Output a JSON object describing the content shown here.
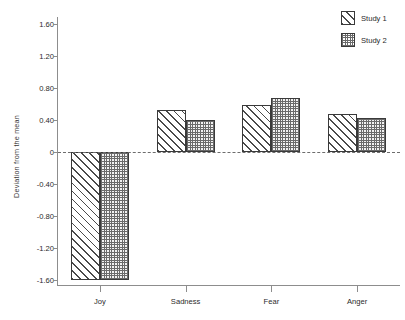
{
  "chart_data": {
    "type": "bar",
    "title": "",
    "subtitle": "",
    "xlabel": "",
    "ylabel": "Deviation from the mean",
    "categories": [
      "Joy",
      "Sadness",
      "Fear",
      "Anger"
    ],
    "series": [
      {
        "name": "Study 1",
        "pattern": "diagonal-hatch",
        "values": [
          -1.6,
          0.52,
          0.59,
          0.47
        ]
      },
      {
        "name": "Study 2",
        "pattern": "checkered-hatch",
        "values": [
          -1.6,
          0.4,
          0.68,
          0.43
        ]
      }
    ],
    "ylim": [
      -1.6,
      1.6
    ],
    "yticks": [
      1.6,
      1.2,
      0.8,
      0.4,
      0,
      -0.4,
      -0.8,
      -1.2,
      -1.6
    ],
    "ytick_labels": [
      "1.60",
      "1.20",
      "0.80",
      "0.40",
      "0",
      "-0.40",
      "-0.80",
      "-1.20",
      "-1.60"
    ],
    "grid": false,
    "zero_line": true,
    "zero_line_style": "dashed",
    "legend_position": "top-right",
    "colors": {
      "axis": "#8d8d8d",
      "bar_outline": "#3a3a3a",
      "hatch": "#4a4a4a",
      "text": "#2b2b2b",
      "background": "#ffffff"
    }
  },
  "legend": {
    "items": [
      {
        "label": "Study 1"
      },
      {
        "label": "Study 2"
      }
    ]
  },
  "axes": {
    "y_title": "Deviation from the mean"
  }
}
